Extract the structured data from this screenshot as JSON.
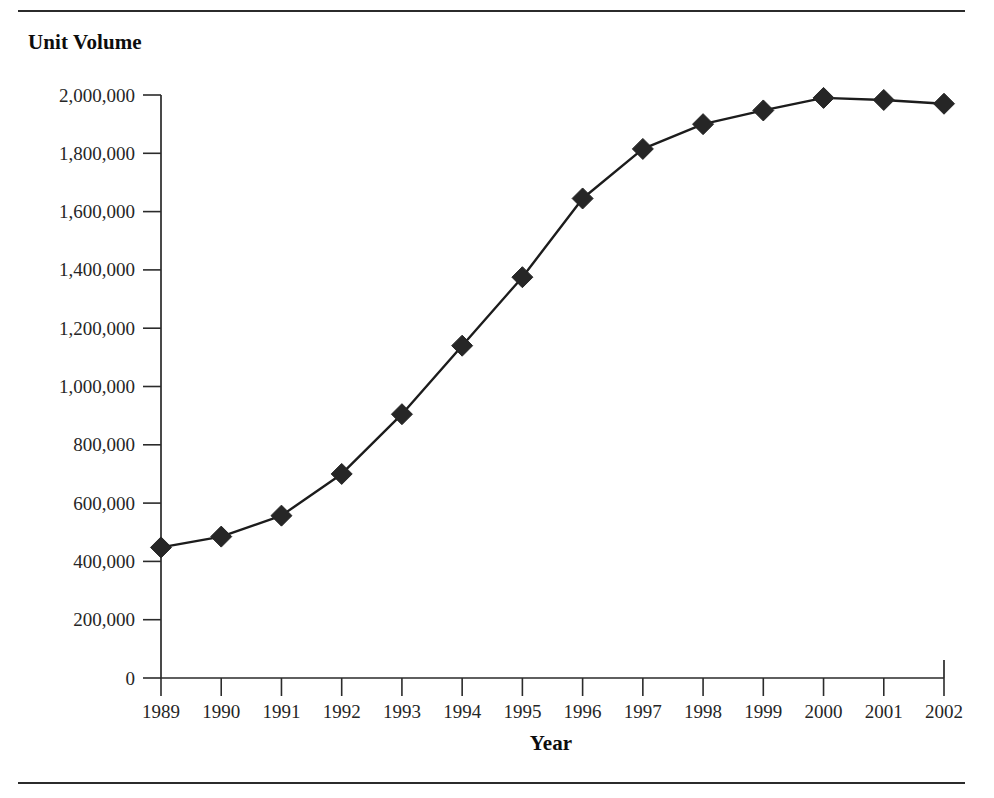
{
  "figure": {
    "rules": {
      "top_label": "top-divider-rule",
      "bottom_label": "bottom-divider-rule"
    }
  },
  "chart_data": {
    "type": "line",
    "title": "",
    "xlabel": "Year",
    "ylabel": "Unit Volume",
    "categories": [
      "1989",
      "1990",
      "1991",
      "1992",
      "1993",
      "1994",
      "1995",
      "1996",
      "1997",
      "1998",
      "1999",
      "2000",
      "2001",
      "2002"
    ],
    "values": [
      448000,
      485000,
      557000,
      700000,
      905000,
      1140000,
      1375000,
      1645000,
      1815000,
      1900000,
      1947000,
      1990000,
      1983000,
      1970000
    ],
    "series": [
      {
        "name": "Unit Volume",
        "values": [
          448000,
          485000,
          557000,
          700000,
          905000,
          1140000,
          1375000,
          1645000,
          1815000,
          1900000,
          1947000,
          1990000,
          1983000,
          1970000
        ]
      }
    ],
    "ylim": [
      0,
      2000000
    ],
    "ytick_values": [
      0,
      200000,
      400000,
      600000,
      800000,
      1000000,
      1200000,
      1400000,
      1600000,
      1800000,
      2000000
    ],
    "ytick_labels": [
      "0",
      "200,000",
      "400,000",
      "600,000",
      "800,000",
      "1,000,000",
      "1,200,000",
      "1,400,000",
      "1,600,000",
      "1,800,000",
      "2,000,000"
    ],
    "xtick_labels": [
      "1989",
      "1990",
      "1991",
      "1992",
      "1993",
      "1994",
      "1995",
      "1996",
      "1997",
      "1998",
      "1999",
      "2000",
      "2001",
      "2002"
    ],
    "grid": false,
    "legend": false,
    "legend_position": "none",
    "marker": "diamond",
    "line_color": "#1c1c1c",
    "marker_color": "#262626",
    "background_color": "#ffffff"
  }
}
